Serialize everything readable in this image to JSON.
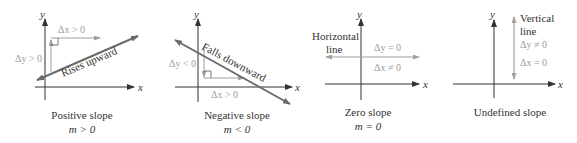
{
  "panels": [
    {
      "id": "positive",
      "caption": "Positive slope",
      "condition": "m > 0",
      "line_label": "Rises upward",
      "dx_label": "Δx > 0",
      "dy_label": "Δy > 0",
      "x_axis_label": "x",
      "y_axis_label": "y"
    },
    {
      "id": "negative",
      "caption": "Negative slope",
      "condition": "m < 0",
      "line_label": "Falls downward",
      "dx_label": "Δx > 0",
      "dy_label": "Δy < 0",
      "x_axis_label": "x",
      "y_axis_label": "y"
    },
    {
      "id": "zero",
      "caption": "Zero slope",
      "condition": "m = 0",
      "line_label_1": "Horizontal",
      "line_label_2": "line",
      "dy_label": "Δy = 0",
      "dx_label": "Δx ≠ 0",
      "x_axis_label": "x",
      "y_axis_label": "y"
    },
    {
      "id": "undefined",
      "caption": "Undefined slope",
      "line_label_1": "Vertical",
      "line_label_2": "line",
      "dy_label": "Δy ≠ 0",
      "dx_label": "Δx = 0",
      "x_axis_label": "x",
      "y_axis_label": "y"
    }
  ],
  "colors": {
    "axis": "#333333",
    "slope_line": "#6a6a6a",
    "delta_lines": "#a0a0a0",
    "delta_text": "#9a9a9a",
    "text": "#333333"
  }
}
